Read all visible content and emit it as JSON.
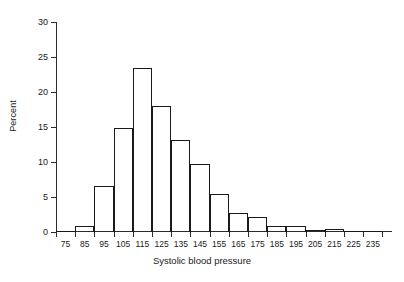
{
  "chart_data": {
    "type": "bar",
    "title": "",
    "subtitle": "",
    "xlabel": "Systolic blood pressure",
    "ylabel": "Percent",
    "xlim": [
      70,
      245
    ],
    "ylim": [
      0,
      30
    ],
    "bin_width": 10,
    "grid": false,
    "legend": null,
    "yticks": [
      0,
      5,
      10,
      15,
      20,
      25,
      30
    ],
    "ytick_labels": [
      "0",
      "5",
      "10",
      "15",
      "20",
      "25",
      "30"
    ],
    "xticks": [
      75,
      85,
      95,
      105,
      115,
      125,
      135,
      145,
      155,
      165,
      175,
      185,
      195,
      205,
      215,
      225,
      235
    ],
    "xtick_labels": [
      "75",
      "85",
      "95",
      "105",
      "115",
      "125",
      "135",
      "145",
      "155",
      "165",
      "175",
      "185",
      "195",
      "205",
      "215",
      "225",
      "235"
    ],
    "categories": [
      "70-80",
      "80-90",
      "90-100",
      "100-110",
      "110-120",
      "120-130",
      "130-140",
      "140-150",
      "150-160",
      "160-170",
      "170-180",
      "180-190",
      "190-200",
      "200-210",
      "210-220",
      "220-230",
      "230-240"
    ],
    "bin_centers": [
      75,
      85,
      95,
      105,
      115,
      125,
      135,
      145,
      155,
      165,
      175,
      185,
      195,
      205,
      215,
      225,
      235
    ],
    "bin_edges": [
      70,
      80,
      90,
      100,
      110,
      120,
      130,
      140,
      150,
      160,
      170,
      180,
      190,
      200,
      210,
      220,
      230,
      240
    ],
    "values": [
      0.2,
      0.9,
      6.6,
      14.8,
      23.4,
      18.0,
      13.1,
      9.7,
      5.5,
      2.7,
      2.1,
      0.9,
      0.9,
      0.3,
      0.5,
      0.0,
      0.15
    ],
    "colors": {
      "bar_edge": "#1a1a1a",
      "bar_fill": "#ffffff",
      "axis": "#2b2b2b",
      "text": "#1a1a1a",
      "background": "#ffffff"
    }
  }
}
